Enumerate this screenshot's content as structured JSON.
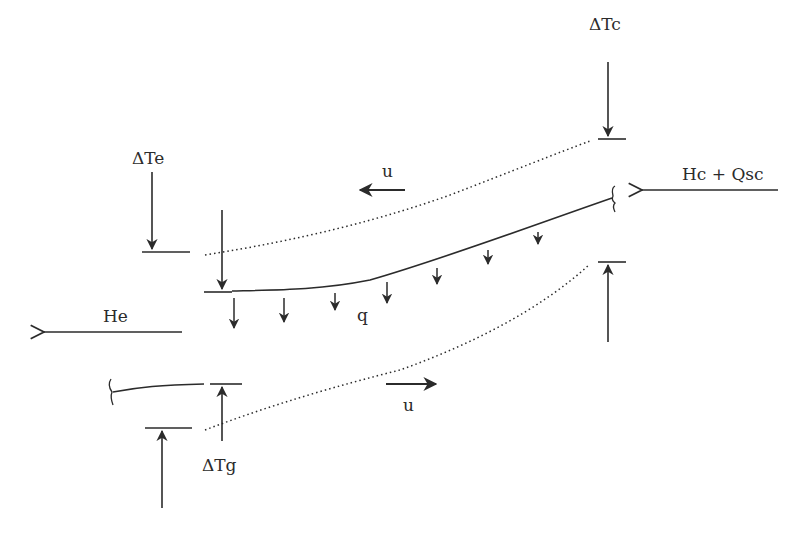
{
  "diagram": {
    "type": "heat-pipe energy balance schematic",
    "colors": {
      "stroke": "#2b2b2b",
      "background": "#ffffff"
    },
    "labels": {
      "delta_tc": "ΔTc",
      "delta_te": "ΔTe",
      "delta_tg": "ΔTg",
      "hc_qsc": "Hc + Qsc",
      "he": "He",
      "q": "q",
      "u_top": "u",
      "u_bottom": "u"
    },
    "elements": [
      {
        "id": "centerline",
        "style": "solid curve",
        "desc": "main wall curve from left bar to right brace"
      },
      {
        "id": "upper-boundary",
        "style": "dotted curve"
      },
      {
        "id": "lower-boundary",
        "style": "dotted curve"
      },
      {
        "id": "q-arrows",
        "count": 7,
        "direction": "down"
      },
      {
        "id": "u-top-arrow",
        "direction": "left"
      },
      {
        "id": "u-bottom-arrow",
        "direction": "right"
      },
      {
        "id": "he-arrow",
        "direction": "left"
      },
      {
        "id": "hc-qsc-arrow",
        "direction": "left"
      }
    ]
  }
}
